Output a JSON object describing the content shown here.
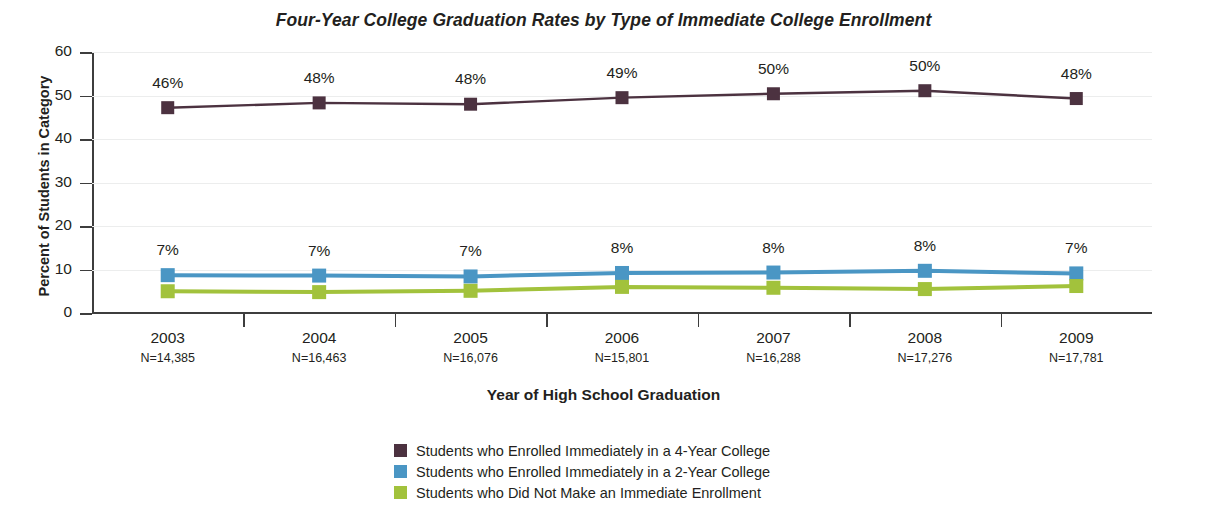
{
  "chart_data": {
    "type": "line",
    "title": "Four-Year College Graduation Rates by Type of Immediate College Enrollment",
    "xlabel": "Year of High School Graduation",
    "ylabel": "Percent of Students in Category",
    "categories": [
      "2003",
      "2004",
      "2005",
      "2006",
      "2007",
      "2008",
      "2009"
    ],
    "category_sublabels": [
      "N=14,385",
      "N=16,463",
      "N=16,076",
      "N=15,801",
      "N=16,288",
      "N=17,276",
      "N=17,781"
    ],
    "ylim": [
      0,
      60
    ],
    "yticks": [
      0,
      10,
      20,
      30,
      40,
      50,
      60
    ],
    "grid": true,
    "legend_position": "bottom",
    "series": [
      {
        "name": "Students who Enrolled Immediately in a 4-Year College",
        "color": "#4c3240",
        "values": [
          47.2,
          48.3,
          48.0,
          49.5,
          50.4,
          51.1,
          49.3
        ],
        "labels": [
          "46%",
          "48%",
          "48%",
          "49%",
          "50%",
          "50%",
          "48%"
        ]
      },
      {
        "name": "Students who Enrolled Immediately in a 2-Year College",
        "color": "#4a96c4",
        "values": [
          8.7,
          8.6,
          8.4,
          9.2,
          9.3,
          9.7,
          9.1
        ],
        "labels": [
          "7%",
          "7%",
          "7%",
          "8%",
          "8%",
          "8%",
          "7%"
        ]
      },
      {
        "name": "Students who Did Not Make an Immediate Enrollment",
        "color": "#a2c23c",
        "values": [
          5.0,
          4.8,
          5.1,
          6.0,
          5.8,
          5.5,
          6.2
        ],
        "labels": [
          "",
          "",
          "",
          "",
          "",
          "",
          ""
        ]
      }
    ]
  },
  "legend": {
    "items": [
      {
        "label": "Students who Enrolled Immediately in a 4-Year College",
        "color": "#4c3240"
      },
      {
        "label": "Students who Enrolled Immediately in a 2-Year College",
        "color": "#4a96c4"
      },
      {
        "label": "Students who Did Not Make an Immediate Enrollment",
        "color": "#a2c23c"
      }
    ]
  }
}
